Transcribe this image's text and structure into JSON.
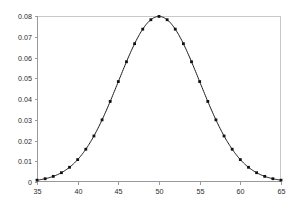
{
  "chart_data": {
    "type": "line",
    "title": "",
    "subtitle": "",
    "xlabel": "",
    "ylabel": "",
    "xlim": [
      35,
      65
    ],
    "ylim": [
      0,
      0.08
    ],
    "grid": false,
    "legend": null,
    "legend_position": "none",
    "marker": "square",
    "marker_color": "#111111",
    "line_color": "#1a1a1a",
    "distribution": "normal",
    "mean": 50,
    "std_dev": 5,
    "xticks": [
      35,
      40,
      45,
      50,
      55,
      60,
      65
    ],
    "xtick_labels": [
      "35",
      "40",
      "45",
      "50",
      "55",
      "60",
      "65"
    ],
    "yticks": [
      0,
      0.01,
      0.02,
      0.03,
      0.04,
      0.05,
      0.06,
      0.07,
      0.08
    ],
    "ytick_labels": [
      "0",
      "0.01",
      "0.02",
      "0.03",
      "0.04",
      "0.05",
      "0.06",
      "0.07",
      "0.08"
    ],
    "x": [
      35,
      36,
      37,
      38,
      39,
      40,
      41,
      42,
      43,
      44,
      45,
      46,
      47,
      48,
      49,
      50,
      51,
      52,
      53,
      54,
      55,
      56,
      57,
      58,
      59,
      60,
      61,
      62,
      63,
      64,
      65
    ],
    "values": [
      0.0009,
      0.0014,
      0.0022,
      0.0033,
      0.0048,
      0.0108,
      0.0158,
      0.0222,
      0.0298,
      0.0484,
      0.0484,
      0.0579,
      0.0666,
      0.0737,
      0.0782,
      0.0798,
      0.0782,
      0.0737,
      0.0666,
      0.0579,
      0.0484,
      0.0388,
      0.0298,
      0.0222,
      0.0158,
      0.0108,
      0.0071,
      0.0048,
      0.0033,
      0.0022,
      0.0009
    ],
    "series": [
      {
        "name": "normal-pdf",
        "values": [
          0.0009,
          0.0014,
          0.0022,
          0.0033,
          0.0048,
          0.0108,
          0.0158,
          0.0222,
          0.0298,
          0.0388,
          0.0484,
          0.0579,
          0.0666,
          0.0737,
          0.0782,
          0.0798,
          0.0782,
          0.0737,
          0.0666,
          0.0579,
          0.0484,
          0.0388,
          0.0298,
          0.0222,
          0.0158,
          0.0108,
          0.0071,
          0.0048,
          0.0033,
          0.0022,
          0.0009
        ]
      }
    ],
    "colors": {
      "background": "#ffffff",
      "axis": "#9a9a9a",
      "frame": "#c9c9c9",
      "text": "#2b2b2b",
      "line": "#1a1a1a",
      "marker": "#111111"
    },
    "geometry": {
      "plot_left": 37,
      "plot_right": 281,
      "plot_top": 16,
      "plot_bottom": 182
    }
  }
}
